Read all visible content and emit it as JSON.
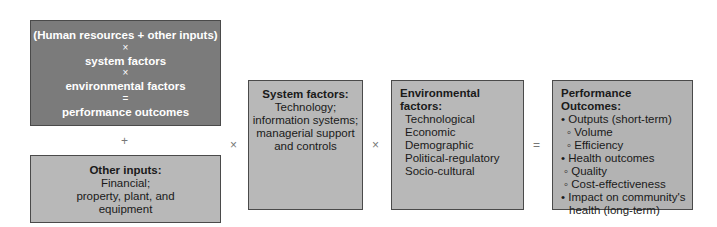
{
  "formula_box": {
    "lines": [
      "(Human resources + other inputs)",
      "×",
      "system factors",
      "×",
      "environmental factors",
      "=",
      "performance outcomes"
    ]
  },
  "operators": {
    "plus": "+",
    "times1": "×",
    "times2": "×",
    "equals": "="
  },
  "other_inputs": {
    "title": "Other inputs:",
    "lines": [
      "Financial;",
      "property, plant, and",
      "equipment"
    ]
  },
  "system_factors": {
    "title": "System factors:",
    "lines": [
      "Technology;",
      "information systems;",
      "managerial support",
      "and controls"
    ]
  },
  "environmental_factors": {
    "title": "Environmental factors:",
    "items": [
      "Technological",
      "Economic",
      "Demographic",
      "Political-regulatory",
      "Socio-cultural"
    ]
  },
  "performance_outcomes": {
    "title": "Performance Outcomes:",
    "lines": [
      "• Outputs (short-term)",
      "◦ Volume",
      "◦ Efficiency",
      "• Health outcomes",
      "◦ Quality",
      "◦ Cost-effectiveness",
      "• Impact on community's",
      "health (long-term)"
    ]
  },
  "colors": {
    "dark_box": "#7b7b7b",
    "light_box": "#b8b8b8",
    "border": "#4a4a4a"
  }
}
